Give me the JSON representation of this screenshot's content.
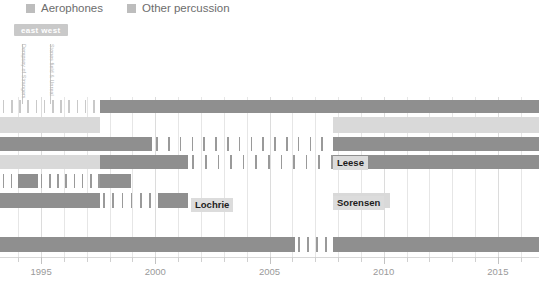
{
  "legend": {
    "items": [
      {
        "label": "Aerophones",
        "color": "#bdbdbd",
        "x": 26,
        "icon": "legend-swatch-icon"
      },
      {
        "label": "Other percussion",
        "color": "#bdbdbd",
        "x": 127,
        "icon": "legend-swatch-icon"
      }
    ]
  },
  "badge": {
    "text": "east west",
    "color": "#c9c9c9"
  },
  "annotations": [
    {
      "text": "Dempsey of Strangers",
      "x": 23,
      "y": 44,
      "stem_top": 44,
      "stem_bottom": 104
    },
    {
      "text": "Stones field & Unreal",
      "x": 51,
      "y": 44,
      "stem_top": 44,
      "stem_bottom": 104
    }
  ],
  "name_labels": [
    {
      "text": "Lochrie",
      "x": 191,
      "y": 198
    },
    {
      "text": "Leese",
      "x": 333,
      "y": 156
    },
    {
      "text": "Sorensen",
      "x": 333,
      "y": 196
    }
  ],
  "colors": {
    "dark_bar": "#8f8f8f",
    "light_bar": "#d9d9d9",
    "pale_bar": "#eaeaea",
    "tick_dark": "#9a9a9a",
    "tick_light": "#c9c9c9",
    "gridline": "#e6e6e6",
    "axis": "#d8d8d8",
    "axis_text": "#9a9a9a",
    "legend_text": "#6d6d6d",
    "label_bg": "#dcdcdc",
    "label_text": "#1c1c1c"
  },
  "chart_data": {
    "type": "bar",
    "title": "",
    "xlabel": "",
    "ylabel": "",
    "grid": true,
    "legend_position": "top-left",
    "xlim": [
      1993.2,
      2016.8
    ],
    "x_ticks_major": [
      1995,
      2000,
      2005,
      2010,
      2015
    ],
    "x_tick_labels": [
      "1995",
      "2000",
      "2005",
      "2010",
      "2015"
    ],
    "x_ticks_minor_step": 1,
    "series": [
      {
        "name": "Aerophones",
        "color": "#8f8f8f"
      },
      {
        "name": "Other percussion",
        "color": "#d9d9d9"
      }
    ],
    "rows": [
      {
        "index": 0,
        "top": 3,
        "height": 13,
        "segments": [
          {
            "start": 0,
            "end": 100,
            "kind": "hatch",
            "color": "#c9c9c9",
            "tick_step": 8.2
          },
          {
            "start": 100,
            "end": 333,
            "kind": "solid",
            "color": "#8f8f8f"
          },
          {
            "start": 333,
            "end": 539,
            "kind": "solid",
            "color": "#8f8f8f"
          }
        ]
      },
      {
        "index": 1,
        "top": 20,
        "height": 16,
        "segments": [
          {
            "start": 0,
            "end": 100,
            "kind": "solid",
            "color": "#d9d9d9"
          },
          {
            "start": 100,
            "end": 333,
            "kind": "empty",
            "color": "#ffffff"
          },
          {
            "start": 333,
            "end": 539,
            "kind": "solid",
            "color": "#d9d9d9"
          }
        ]
      },
      {
        "index": 2,
        "top": 40,
        "height": 14,
        "segments": [
          {
            "start": 0,
            "end": 152,
            "kind": "solid",
            "color": "#8f8f8f"
          },
          {
            "start": 152,
            "end": 333,
            "kind": "hatch",
            "color": "#9a9a9a",
            "tick_step": 11.8
          },
          {
            "start": 333,
            "end": 539,
            "kind": "solid",
            "color": "#8f8f8f"
          }
        ]
      },
      {
        "index": 3,
        "top": 58,
        "height": 14,
        "segments": [
          {
            "start": 0,
            "end": 100,
            "kind": "solid",
            "color": "#d9d9d9"
          },
          {
            "start": 100,
            "end": 188,
            "kind": "solid",
            "color": "#8f8f8f"
          },
          {
            "start": 188,
            "end": 333,
            "kind": "hatch",
            "color": "#9a9a9a",
            "tick_step": 12.6
          },
          {
            "start": 333,
            "end": 539,
            "kind": "solid",
            "color": "#8f8f8f"
          }
        ]
      },
      {
        "index": 4,
        "top": 77,
        "height": 14,
        "segments": [
          {
            "start": 0,
            "end": 18,
            "kind": "hatch",
            "color": "#9a9a9a",
            "tick_step": 8.0
          },
          {
            "start": 18,
            "end": 38,
            "kind": "solid",
            "color": "#8f8f8f"
          },
          {
            "start": 38,
            "end": 100,
            "kind": "hatch",
            "color": "#9a9a9a",
            "tick_step": 8.2
          },
          {
            "start": 100,
            "end": 131,
            "kind": "solid",
            "color": "#8f8f8f"
          },
          {
            "start": 131,
            "end": 539,
            "kind": "empty",
            "color": "#ffffff"
          }
        ]
      },
      {
        "index": 5,
        "top": 96,
        "height": 15,
        "segments": [
          {
            "start": 0,
            "end": 100,
            "kind": "solid",
            "color": "#8f8f8f"
          },
          {
            "start": 100,
            "end": 158,
            "kind": "hatch",
            "color": "#9a9a9a",
            "tick_step": 9.2
          },
          {
            "start": 158,
            "end": 188,
            "kind": "solid",
            "color": "#8f8f8f"
          },
          {
            "start": 188,
            "end": 333,
            "kind": "empty",
            "color": "#ffffff"
          },
          {
            "start": 333,
            "end": 390,
            "kind": "solid",
            "color": "#d9d9d9"
          },
          {
            "start": 390,
            "end": 539,
            "kind": "empty",
            "color": "#ffffff"
          }
        ]
      },
      {
        "index": 6,
        "top": 140,
        "height": 15,
        "segments": [
          {
            "start": 0,
            "end": 203,
            "kind": "solid",
            "color": "#8f8f8f"
          },
          {
            "start": 203,
            "end": 295,
            "kind": "solid",
            "color": "#8f8f8f"
          },
          {
            "start": 295,
            "end": 333,
            "kind": "hatch",
            "color": "#9a9a9a",
            "tick_step": 9.0
          },
          {
            "start": 333,
            "end": 539,
            "kind": "solid",
            "color": "#8f8f8f"
          }
        ]
      }
    ]
  }
}
